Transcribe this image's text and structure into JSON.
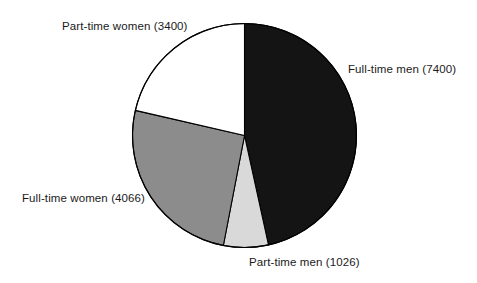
{
  "chart_data": {
    "type": "pie",
    "title": "",
    "subtitle": "",
    "xlabel": "",
    "ylabel": "",
    "legend_position": "none",
    "grid": false,
    "total": 15892,
    "start_angle_deg": 0,
    "direction": "clockwise",
    "categories": [
      "Full-time men",
      "Part-time men",
      "Full-time women",
      "Part-time women"
    ],
    "values": [
      7400,
      1026,
      4066,
      3400
    ],
    "slices": [
      {
        "name": "Full-time men",
        "value": 7400,
        "label": "Full-time men (7400)",
        "percent": 46.6,
        "angle_deg": 167.6,
        "color": "#141414",
        "stroke": "#000000"
      },
      {
        "name": "Part-time men",
        "value": 1026,
        "label": "Part-time men (1026)",
        "percent": 6.5,
        "angle_deg": 23.2,
        "color": "#d9d9d9",
        "stroke": "#000000"
      },
      {
        "name": "Full-time women",
        "value": 4066,
        "label": "Full-time women (4066)",
        "percent": 25.6,
        "angle_deg": 92.1,
        "color": "#8c8c8c",
        "stroke": "#000000"
      },
      {
        "name": "Part-time women",
        "value": 3400,
        "label": "Part-time women (3400)",
        "percent": 21.4,
        "angle_deg": 77.0,
        "color": "#ffffff",
        "stroke": "#000000"
      }
    ]
  },
  "labels": {
    "full_time_men": "Full-time men (7400)",
    "part_time_men": "Part-time men (1026)",
    "full_time_women": "Full-time women (4066)",
    "part_time_women": "Part-time women (3400)"
  },
  "colors": {
    "background": "#ffffff",
    "text": "#1a1a1a",
    "outline": "#000000",
    "slice_full_time_men": "#141414",
    "slice_part_time_men": "#d9d9d9",
    "slice_full_time_women": "#8c8c8c",
    "slice_part_time_women": "#ffffff"
  }
}
